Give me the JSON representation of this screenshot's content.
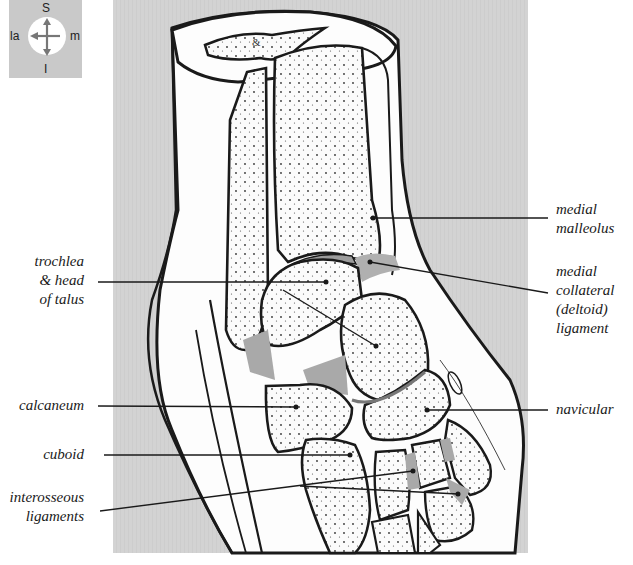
{
  "figure": {
    "panel_color": "#d2d2d2",
    "bone_fill": "#fbfbfb",
    "cartilage_ligament_gray": "#a9a9a9",
    "outline_color": "#1a1a1a"
  },
  "compass": {
    "superior": "S",
    "inferior": "I",
    "lateral": "la",
    "medial": "m",
    "icon": "orientation-compass-icon"
  },
  "labels": {
    "medial_malleolus": {
      "lines": [
        "medial",
        "malleolus"
      ]
    },
    "medial_collateral": {
      "lines": [
        "medial",
        "collateral",
        "(deltoid)",
        "ligament"
      ]
    },
    "trochlea_talus": {
      "lines": [
        "trochlea",
        "& head",
        "of talus"
      ]
    },
    "calcaneum": {
      "lines": [
        "calcaneum"
      ]
    },
    "navicular": {
      "lines": [
        "navicular"
      ]
    },
    "cuboid": {
      "lines": [
        "cuboid"
      ]
    },
    "interosseous": {
      "lines": [
        "interosseous",
        "ligaments"
      ]
    }
  }
}
